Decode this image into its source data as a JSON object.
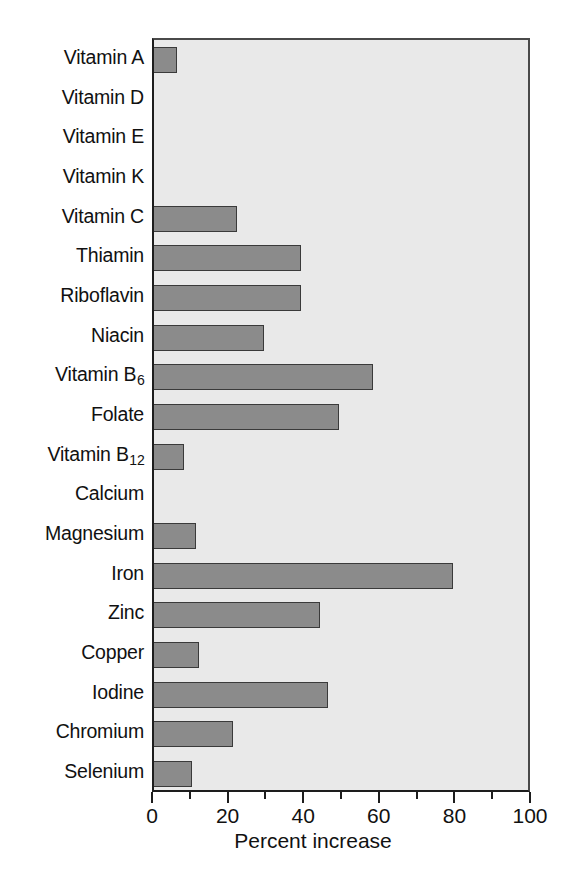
{
  "chart_data": {
    "type": "bar",
    "orientation": "horizontal",
    "title": "",
    "xlabel": "Percent increase",
    "ylabel": "",
    "xlim": [
      0,
      100
    ],
    "xticks": [
      0,
      20,
      40,
      60,
      80,
      100
    ],
    "xtick_labels": [
      "0",
      "20",
      "40",
      "60",
      "80",
      "100"
    ],
    "minor_tick_step": 10,
    "grid": false,
    "legend": null,
    "bar_color": "#8b8b8b",
    "bar_edge_color": "#3a3a3a",
    "plot_background": "#e9e9e9",
    "categories": [
      "Vitamin A",
      "Vitamin D",
      "Vitamin E",
      "Vitamin K",
      "Vitamin C",
      "Thiamin",
      "Riboflavin",
      "Niacin",
      "Vitamin B6",
      "Folate",
      "Vitamin B12",
      "Calcium",
      "Magnesium",
      "Iron",
      "Zinc",
      "Copper",
      "Iodine",
      "Chromium",
      "Selenium"
    ],
    "category_labels_html": [
      "Vitamin A",
      "Vitamin D",
      "Vitamin E",
      "Vitamin K",
      "Vitamin C",
      "Thiamin",
      "Riboflavin",
      "Niacin",
      "Vitamin B<sub>6</sub>",
      "Folate",
      "Vitamin B<sub>12</sub>",
      "Calcium",
      "Magnesium",
      "Iron",
      "Zinc",
      "Copper",
      "Iodine",
      "Chromium",
      "Selenium"
    ],
    "values": [
      6,
      0,
      0,
      0,
      22,
      39,
      39,
      29,
      58,
      49,
      8,
      0,
      11,
      79,
      44,
      12,
      46,
      21,
      10
    ]
  }
}
